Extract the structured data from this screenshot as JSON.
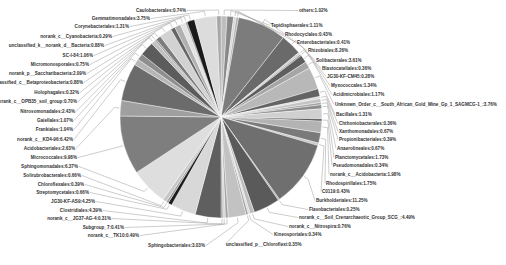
{
  "chart_data": {
    "type": "pie",
    "title": "",
    "center": [
      221,
      117
    ],
    "radius": 101,
    "start_angle_deg": -90,
    "legend": "none",
    "slices": [
      {
        "label": "others",
        "value": 1.02,
        "color": "#bdbdbd",
        "lx": 299,
        "ly": 12,
        "anchor": "start"
      },
      {
        "label": "Tepidisphaerales",
        "value": 1.11,
        "color": "#888888",
        "lx": 271,
        "ly": 27,
        "anchor": "start"
      },
      {
        "label": "Rhodocyclales",
        "value": 0.43,
        "color": "#d6d6d6",
        "lx": 285,
        "ly": 36,
        "anchor": "start"
      },
      {
        "label": "Enterobacteriales",
        "value": 0.41,
        "color": "#b0b0b0",
        "lx": 297,
        "ly": 44,
        "anchor": "start"
      },
      {
        "label": "Rhizobiales",
        "value": 8.26,
        "color": "#7c7c7c",
        "lx": 308,
        "ly": 52,
        "anchor": "start"
      },
      {
        "label": "Solibacterales",
        "value": 3.61,
        "color": "#6a6a6a",
        "lx": 316,
        "ly": 62,
        "anchor": "start"
      },
      {
        "label": "Blastocatellales",
        "value": 0.36,
        "color": "#cfcfcf",
        "lx": 322,
        "ly": 70,
        "anchor": "start"
      },
      {
        "label": "JG30-KF-CM45",
        "value": 0.28,
        "color": "#9e9e9e",
        "lx": 327,
        "ly": 78,
        "anchor": "start"
      },
      {
        "label": "Myxococcales",
        "value": 1.34,
        "color": "#5e5e5e",
        "lx": 331,
        "ly": 87,
        "anchor": "start"
      },
      {
        "label": "Acidimicrobiales",
        "value": 1.17,
        "color": "#a5a5a5",
        "lx": 333,
        "ly": 96,
        "anchor": "start"
      },
      {
        "label": "Unknown_Order_c__South_African_Gold_Mine_Gp_1_SAGMCG-1_",
        "value": 3.76,
        "color": "#b8b8b8",
        "lx": 335,
        "ly": 106,
        "anchor": "start"
      },
      {
        "label": "Bacillales",
        "value": 1.31,
        "color": "#636363",
        "lx": 336,
        "ly": 116,
        "anchor": "start"
      },
      {
        "label": "Chthoniobacterales",
        "value": 0.36,
        "color": "#dadada",
        "lx": 339,
        "ly": 125,
        "anchor": "start"
      },
      {
        "label": "Xanthomonadales",
        "value": 0.67,
        "color": "#c4c4c4",
        "lx": 339,
        "ly": 133,
        "anchor": "start"
      },
      {
        "label": "Propionibacteriales",
        "value": 0.39,
        "color": "#a0a0a0",
        "lx": 339,
        "ly": 141,
        "anchor": "start"
      },
      {
        "label": "Anaerolineales",
        "value": 0.67,
        "color": "#8c8c8c",
        "lx": 337,
        "ly": 150,
        "anchor": "start"
      },
      {
        "label": "Planctomycetales",
        "value": 1.73,
        "color": "#d0d0d0",
        "lx": 335,
        "ly": 159,
        "anchor": "start"
      },
      {
        "label": "Pseudomonadales",
        "value": 0.34,
        "color": "#4a4a4a",
        "lx": 333,
        "ly": 167,
        "anchor": "start"
      },
      {
        "label": "norank_c__Acidobacteria",
        "value": 1.98,
        "color": "#b3b3b3",
        "lx": 330,
        "ly": 176,
        "anchor": "start"
      },
      {
        "label": "Rhodospirillales",
        "value": 1.75,
        "color": "#7a7a7a",
        "lx": 326,
        "ly": 185,
        "anchor": "start"
      },
      {
        "label": "C0119",
        "value": 0.43,
        "color": "#c8c8c8",
        "lx": 322,
        "ly": 193,
        "anchor": "start"
      },
      {
        "label": "Burkholderiales",
        "value": 11.25,
        "color": "#6f6f6f",
        "lx": 316,
        "ly": 202,
        "anchor": "start"
      },
      {
        "label": "Flavobacteriales",
        "value": 0.25,
        "color": "#a8a8a8",
        "lx": 309,
        "ly": 211,
        "anchor": "start"
      },
      {
        "label": "norank_c__Soil_Crenarchaeotic_Group_SCG_",
        "value": 4.49,
        "color": "#5a5a5a",
        "lx": 299,
        "ly": 219,
        "anchor": "start"
      },
      {
        "label": "norank_c__Nitrospira",
        "value": 0.76,
        "color": "#bcbcbc",
        "lx": 289,
        "ly": 228,
        "anchor": "start"
      },
      {
        "label": "Kineosporiales",
        "value": 0.34,
        "color": "#dcdcdc",
        "lx": 274,
        "ly": 236,
        "anchor": "start"
      },
      {
        "label": "unclassified_p__Chloroflexi",
        "value": 0.35,
        "color": "#9c9c9c",
        "lx": 226,
        "ly": 246,
        "anchor": "start"
      },
      {
        "label": "Sphingobacteriales",
        "value": 3.03,
        "color": "#c2c2c2",
        "lx": 205,
        "ly": 247,
        "anchor": "end"
      },
      {
        "label": "norank_c__TK10",
        "value": 0.49,
        "color": "#a3a3a3",
        "lx": 139,
        "ly": 237,
        "anchor": "end"
      },
      {
        "label": "Subgroup_7",
        "value": 0.41,
        "color": "#d4d4d4",
        "lx": 124,
        "ly": 229,
        "anchor": "end"
      },
      {
        "label": "norank_c__JG37-AG-4",
        "value": 0.31,
        "color": "#8a8a8a",
        "lx": 111,
        "ly": 220,
        "anchor": "end"
      },
      {
        "label": "Clostridiales",
        "value": 4.39,
        "color": "#5f5f5f",
        "lx": 102,
        "ly": 212,
        "anchor": "end"
      },
      {
        "label": "JG30-KF-AS9",
        "value": 4.25,
        "color": "#d8d8d8",
        "lx": 95,
        "ly": 203,
        "anchor": "end"
      },
      {
        "label": "Streptomycetales",
        "value": 0.66,
        "color": "#1e1e1e",
        "lx": 89,
        "ly": 194,
        "anchor": "end"
      },
      {
        "label": "Chloroflexales",
        "value": 0.39,
        "color": "#9a9a9a",
        "lx": 84,
        "ly": 186,
        "anchor": "end"
      },
      {
        "label": "Solirubrobacterales",
        "value": 0.66,
        "color": "#c6c6c6",
        "lx": 81,
        "ly": 177,
        "anchor": "end"
      },
      {
        "label": "Sphingomonadales",
        "value": 6.37,
        "color": "#dedede",
        "lx": 78,
        "ly": 168,
        "anchor": "end"
      },
      {
        "label": "Micrococcales",
        "value": 9.98,
        "color": "#7e7e7e",
        "lx": 77,
        "ly": 159,
        "anchor": "end"
      },
      {
        "label": "Acidobacteriales",
        "value": 2.63,
        "color": "#9f9f9f",
        "lx": 75,
        "ly": 150,
        "anchor": "end"
      },
      {
        "label": "norank_c__KD4-96",
        "value": 6.42,
        "color": "#6b6b6b",
        "lx": 73,
        "ly": 141,
        "anchor": "end"
      },
      {
        "label": "Frankiales",
        "value": 1.04,
        "color": "#b6b6b6",
        "lx": 73,
        "ly": 131,
        "anchor": "end"
      },
      {
        "label": "Gaiellales",
        "value": 1.07,
        "color": "#8e8e8e",
        "lx": 73,
        "ly": 122,
        "anchor": "end"
      },
      {
        "label": "Nitrosomonadales",
        "value": 2.43,
        "color": "#5c5c5c",
        "lx": 75,
        "ly": 113,
        "anchor": "end"
      },
      {
        "label": "norank_c__OPB35_soil_group",
        "value": 0.7,
        "color": "#c0c0c0",
        "lx": 77,
        "ly": 103,
        "anchor": "end"
      },
      {
        "label": "Holophagales",
        "value": 0.32,
        "color": "#a2a2a2",
        "lx": 79,
        "ly": 94,
        "anchor": "end"
      },
      {
        "label": "unclassified_c__Betaproteobacteria",
        "value": 0.88,
        "color": "#7d7d7d",
        "lx": 83,
        "ly": 84,
        "anchor": "end"
      },
      {
        "label": "norank_p__Saccharibacteria",
        "value": 2.09,
        "color": "#d2d2d2",
        "lx": 86,
        "ly": 75,
        "anchor": "end"
      },
      {
        "label": "Micromonosporales",
        "value": 0.75,
        "color": "#666666",
        "lx": 89,
        "ly": 66,
        "anchor": "end"
      },
      {
        "label": "SC-I-84",
        "value": 1.06,
        "color": "#b1b1b1",
        "lx": 93,
        "ly": 57,
        "anchor": "end"
      },
      {
        "label": "unclassified_k__norank_d__Bacteria",
        "value": 0.88,
        "color": "#e2e2e2",
        "lx": 104,
        "ly": 47,
        "anchor": "end"
      },
      {
        "label": "norank_c__Cyanobacteria",
        "value": 0.29,
        "color": "#959595",
        "lx": 112,
        "ly": 38,
        "anchor": "end"
      },
      {
        "label": "Corynebacteriales",
        "value": 1.31,
        "color": "#1a1a1a",
        "lx": 129,
        "ly": 28,
        "anchor": "end"
      },
      {
        "label": "Gemmatimonadales",
        "value": 3.75,
        "color": "#dcdcdc",
        "lx": 150,
        "ly": 20,
        "anchor": "end"
      },
      {
        "label": "Caulobacterales",
        "value": 0.74,
        "color": "#a7a7a7",
        "lx": 186,
        "ly": 12,
        "anchor": "end"
      }
    ]
  }
}
